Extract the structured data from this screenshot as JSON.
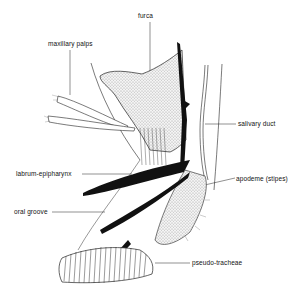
{
  "diagram": {
    "labels": {
      "furca": "furca",
      "maxillary_palps": "maxillary palps",
      "salivary_duct": "salivary duct",
      "labrum_epipharynx": "labrum-epipharynx",
      "apodeme": "apodeme (stipes)",
      "oral_groove": "oral groove",
      "pseudo_tracheae": "pseudo-tracheae"
    }
  }
}
